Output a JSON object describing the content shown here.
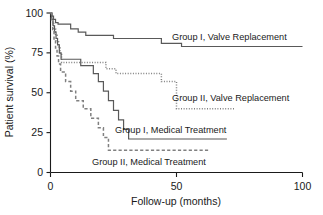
{
  "chart_data": {
    "type": "line",
    "title": "",
    "xlabel": "Follow-up (months)",
    "ylabel": "Patient survival (%)",
    "xlim": [
      0,
      100
    ],
    "ylim": [
      0,
      100
    ],
    "xticks": [
      0,
      50,
      100
    ],
    "yticks": [
      0,
      25,
      50,
      75,
      100
    ],
    "xtick_labels": [
      "0",
      "50",
      "100"
    ],
    "ytick_labels": [
      "0",
      "25",
      "50",
      "75",
      "100"
    ],
    "grid": false,
    "legend_position": "inline-annotations",
    "series": [
      {
        "name": "Group I, Valve Replacement",
        "style": "solid",
        "color": "#595959",
        "label": "Group I, Valve Replacement",
        "points": [
          [
            0,
            100
          ],
          [
            0.6,
            100
          ],
          [
            0.6,
            98
          ],
          [
            1.2,
            98
          ],
          [
            1.2,
            96
          ],
          [
            2.0,
            96
          ],
          [
            2.0,
            94
          ],
          [
            3.0,
            94
          ],
          [
            3.0,
            93
          ],
          [
            8.0,
            93
          ],
          [
            8.0,
            90
          ],
          [
            11.0,
            90
          ],
          [
            11.0,
            88
          ],
          [
            14.0,
            88
          ],
          [
            14.0,
            86
          ],
          [
            25.0,
            86
          ],
          [
            25.0,
            84
          ],
          [
            44.0,
            84
          ],
          [
            44.0,
            81
          ],
          [
            52.0,
            81
          ],
          [
            52.0,
            79
          ],
          [
            100.0,
            79
          ]
        ]
      },
      {
        "name": "Group II, Valve Replacement",
        "style": "dotted",
        "color": "#808080",
        "label": "Group II, Valve Replacement",
        "points": [
          [
            0,
            100
          ],
          [
            0.4,
            100
          ],
          [
            0.4,
            97
          ],
          [
            0.8,
            97
          ],
          [
            0.8,
            94
          ],
          [
            1.3,
            94
          ],
          [
            1.3,
            90
          ],
          [
            2.0,
            90
          ],
          [
            2.0,
            86
          ],
          [
            2.6,
            86
          ],
          [
            2.6,
            82
          ],
          [
            3.2,
            82
          ],
          [
            3.2,
            78
          ],
          [
            3.8,
            78
          ],
          [
            3.8,
            74
          ],
          [
            4.4,
            74
          ],
          [
            4.4,
            69
          ],
          [
            22.0,
            69
          ],
          [
            22.0,
            65
          ],
          [
            26.0,
            65
          ],
          [
            26.0,
            62
          ],
          [
            44.0,
            62
          ],
          [
            44.0,
            57
          ],
          [
            50.0,
            57
          ],
          [
            50.0,
            40
          ],
          [
            73.0,
            40
          ]
        ]
      },
      {
        "name": "Group I, Medical Treatment",
        "style": "solid",
        "color": "#595959",
        "label": "Group I, Medical Treatment",
        "points": [
          [
            0,
            100
          ],
          [
            0.5,
            100
          ],
          [
            0.5,
            96
          ],
          [
            1.0,
            96
          ],
          [
            1.0,
            92
          ],
          [
            1.6,
            92
          ],
          [
            1.6,
            88
          ],
          [
            2.2,
            88
          ],
          [
            2.2,
            84
          ],
          [
            2.8,
            84
          ],
          [
            2.8,
            80
          ],
          [
            3.5,
            80
          ],
          [
            3.5,
            75
          ],
          [
            4.2,
            75
          ],
          [
            4.2,
            71
          ],
          [
            12.0,
            71
          ],
          [
            12.0,
            67
          ],
          [
            17.0,
            67
          ],
          [
            17.0,
            62
          ],
          [
            19.0,
            62
          ],
          [
            19.0,
            57
          ],
          [
            21.0,
            57
          ],
          [
            21.0,
            51
          ],
          [
            23.0,
            51
          ],
          [
            23.0,
            45
          ],
          [
            25.0,
            45
          ],
          [
            25.0,
            39
          ],
          [
            27.0,
            39
          ],
          [
            27.0,
            33
          ],
          [
            29.0,
            33
          ],
          [
            29.0,
            27
          ],
          [
            31.0,
            27
          ],
          [
            31.0,
            21
          ],
          [
            70.0,
            21
          ]
        ]
      },
      {
        "name": "Group II, Medical Treatment",
        "style": "dashed",
        "color": "#808080",
        "label": "Group II, Medical Treatment",
        "points": [
          [
            0,
            100
          ],
          [
            0.4,
            100
          ],
          [
            0.4,
            95
          ],
          [
            0.9,
            95
          ],
          [
            0.9,
            89
          ],
          [
            1.4,
            89
          ],
          [
            1.4,
            83
          ],
          [
            2.0,
            83
          ],
          [
            2.0,
            78
          ],
          [
            2.6,
            78
          ],
          [
            2.6,
            73
          ],
          [
            3.2,
            73
          ],
          [
            3.2,
            68
          ],
          [
            4.0,
            68
          ],
          [
            4.0,
            63
          ],
          [
            6.0,
            63
          ],
          [
            6.0,
            57
          ],
          [
            8.0,
            57
          ],
          [
            8.0,
            51
          ],
          [
            10.0,
            51
          ],
          [
            10.0,
            45
          ],
          [
            13.0,
            45
          ],
          [
            13.0,
            40
          ],
          [
            16.0,
            40
          ],
          [
            16.0,
            34
          ],
          [
            19.0,
            34
          ],
          [
            19.0,
            28
          ],
          [
            21.0,
            28
          ],
          [
            21.0,
            22
          ],
          [
            23.0,
            22
          ],
          [
            23.0,
            14
          ],
          [
            63.0,
            14
          ]
        ]
      }
    ],
    "annotations": [
      {
        "text": "Group I, Valve Replacement",
        "x": 52,
        "y": 86
      },
      {
        "text": "Group II, Valve Replacement",
        "x": 46,
        "y": 45
      },
      {
        "text": "Group I, Medical Treatment",
        "x": 31,
        "y": 27
      },
      {
        "text": "Group II, Medical Treatment",
        "x": 22,
        "y": 10
      }
    ],
    "colors": {
      "axis": "#1a1a1a",
      "solid_line": "#595959",
      "dotted_line": "#808080",
      "background": "#ffffff"
    }
  }
}
